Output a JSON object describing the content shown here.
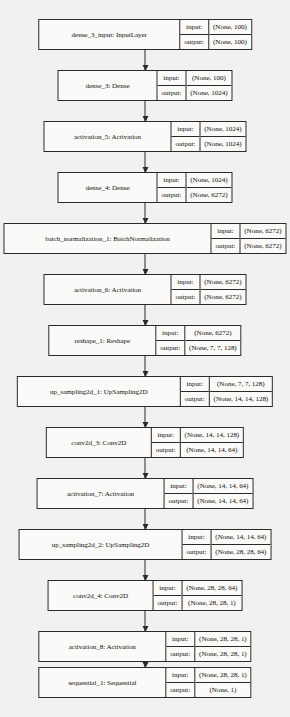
{
  "diagram": {
    "io_labels": {
      "input": "input:",
      "output": "output:"
    },
    "caption": "",
    "colors": {
      "background": "#f2f1ef",
      "node_fill": "#fbfaf8",
      "stroke": "#2a2a2a",
      "text": "#111111"
    },
    "nodes": [
      {
        "name": "dense_3_input: InputLayer",
        "input_shape": "(None, 100)",
        "output_shape": "(None, 100)",
        "top": 19,
        "name_width": 130
      },
      {
        "name": "dense_3: Dense",
        "input_shape": "(None, 100)",
        "output_shape": "(None, 1024)",
        "top": 70,
        "name_width": 88
      },
      {
        "name": "activation_5: Activation",
        "input_shape": "(None, 1024)",
        "output_shape": "(None, 1024)",
        "top": 121,
        "name_width": 116
      },
      {
        "name": "dense_4: Dense",
        "input_shape": "(None, 1024)",
        "output_shape": "(None, 6272)",
        "top": 172,
        "name_width": 88
      },
      {
        "name": "batch_normalization_1: BatchNormalization",
        "input_shape": "(None, 6272)",
        "output_shape": "(None, 6272)",
        "top": 223,
        "name_width": 196
      },
      {
        "name": "activation_6: Activation",
        "input_shape": "(None, 6272)",
        "output_shape": "(None, 6272)",
        "top": 274,
        "name_width": 116
      },
      {
        "name": "reshape_1: Reshape",
        "input_shape": "(None, 6272)",
        "output_shape": "(None, 7, 7, 128)",
        "top": 325,
        "name_width": 96
      },
      {
        "name": "up_sampling2d_1: UpSampling2D",
        "input_shape": "(None, 7, 7, 128)",
        "output_shape": "(None, 14, 14, 128)",
        "top": 376,
        "name_width": 152
      },
      {
        "name": "conv2d_3: Conv2D",
        "input_shape": "(None, 14, 14, 128)",
        "output_shape": "(None, 14, 14, 64)",
        "top": 427,
        "name_width": 94
      },
      {
        "name": "activation_7: Activation",
        "input_shape": "(None, 14, 14, 64)",
        "output_shape": "(None, 14, 14, 64)",
        "top": 478,
        "name_width": 116
      },
      {
        "name": "up_sampling2d_2: UpSampling2D",
        "input_shape": "(None, 14, 14, 64)",
        "output_shape": "(None, 28, 28, 64)",
        "top": 529,
        "name_width": 152
      },
      {
        "name": "conv2d_4: Conv2D",
        "input_shape": "(None, 28, 28, 64)",
        "output_shape": "(None, 28, 28, 1)",
        "top": 580,
        "name_width": 94
      },
      {
        "name": "activation_8: Activation",
        "input_shape": "(None, 28, 28, 1)",
        "output_shape": "(None, 28, 28, 1)",
        "top": 631,
        "name_width": 116
      },
      {
        "name": "sequential_1: Sequential",
        "input_shape": "(None, 28, 28, 1)",
        "output_shape": "(None, 1)",
        "top": 667,
        "name_width": 116
      }
    ]
  }
}
